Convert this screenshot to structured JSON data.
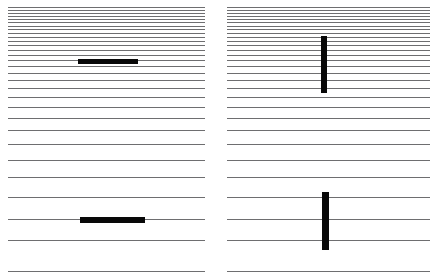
{
  "figure": {
    "width": 437,
    "height": 277,
    "background_color": "#ffffff",
    "rule_color": "#6e6e70",
    "mark_color": "#080808"
  },
  "chart_data": {
    "type": "diagram",
    "title": "",
    "subtitle": "",
    "xlabel": "",
    "ylabel": "",
    "grid": true,
    "legend": false,
    "panels": [
      {
        "name": "left-panel",
        "x": 8,
        "width": 197,
        "rule_y": [
          7,
          10,
          13,
          16,
          19,
          22,
          25.5,
          29,
          32.5,
          36.5,
          40.5,
          45,
          49.5,
          54.5,
          60,
          66,
          72.5,
          79.5,
          87.5,
          96.5,
          106.5,
          117.5,
          130,
          144,
          159.5,
          177,
          196.5,
          218.5,
          240,
          271
        ],
        "marks": [
          {
            "name": "upper-bar",
            "orientation": "horizontal",
            "x": 78,
            "y": 59,
            "width": 60,
            "height": 5
          },
          {
            "name": "lower-bar",
            "orientation": "horizontal",
            "x": 80,
            "y": 217,
            "width": 65,
            "height": 6
          }
        ]
      },
      {
        "name": "right-panel",
        "x": 227,
        "width": 203,
        "rule_y": [
          7,
          10,
          13,
          16,
          19,
          22,
          25.5,
          29,
          32.5,
          36.5,
          40.5,
          45,
          49.5,
          54.5,
          60,
          66,
          72.5,
          79.5,
          87.5,
          96.5,
          106.5,
          117.5,
          130,
          144,
          159.5,
          177,
          196.5,
          218.5,
          240,
          271
        ],
        "marks": [
          {
            "name": "upper-bar",
            "orientation": "vertical",
            "x": 321,
            "y": 36,
            "width": 6,
            "height": 57
          },
          {
            "name": "lower-bar",
            "orientation": "vertical",
            "x": 322,
            "y": 192,
            "width": 7,
            "height": 58
          }
        ]
      }
    ]
  }
}
